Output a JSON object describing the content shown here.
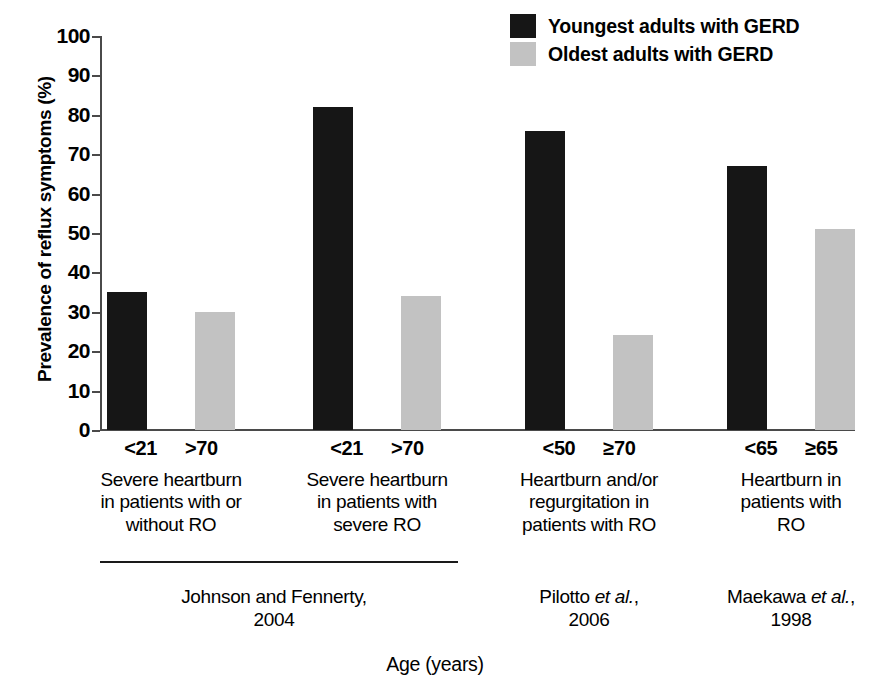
{
  "chart_data": {
    "type": "bar",
    "title": "",
    "xlabel": "Age (years)",
    "ylabel": "Prevalence of reflux symptoms (%)",
    "ylim": [
      0,
      100
    ],
    "ytick_step": 10,
    "yticks": [
      "100",
      "90",
      "80",
      "70",
      "60",
      "50",
      "40",
      "30",
      "20",
      "10",
      "0"
    ],
    "grid": false,
    "legend_position": "top-right",
    "series": [
      {
        "name": "Youngest adults with GERD",
        "color": "#161616",
        "values": [
          35,
          82,
          76,
          67
        ]
      },
      {
        "name": "Oldest adults with GERD",
        "color": "#c2c2c2",
        "values": [
          30,
          34,
          24,
          51
        ]
      }
    ],
    "groups": [
      {
        "age_young": "<21",
        "age_old": ">70",
        "description": "Severe heartburn in patients with or without RO",
        "description_lines": [
          "Severe heartburn",
          "in patients with or",
          "without RO"
        ]
      },
      {
        "age_young": "<21",
        "age_old": ">70",
        "description": "Severe heartburn in patients with severe RO",
        "description_lines": [
          "Severe heartburn",
          "in patients with",
          "severe RO"
        ]
      },
      {
        "age_young": "<50",
        "age_old": "≥70",
        "description": "Heartburn and/or regurgitation in patients with RO",
        "description_lines": [
          "Heartburn and/or",
          "regurgitation in",
          "patients with RO"
        ]
      },
      {
        "age_young": "<65",
        "age_old": "≥65",
        "description": "Heartburn in patients with RO",
        "description_lines": [
          "Heartburn in",
          "patients with",
          "RO"
        ]
      }
    ],
    "studies": [
      {
        "authors": "Johnson and Fennerty,",
        "authors_plain": "Johnson and Fennerty,",
        "italic": "",
        "year": "2004",
        "groups": [
          0,
          1
        ]
      },
      {
        "authors": "Pilotto",
        "italic": "et al.",
        "suffix": ",",
        "year": "2006",
        "groups": [
          2
        ]
      },
      {
        "authors": "Maekawa",
        "italic": "et al.",
        "suffix": ",",
        "year": "1998",
        "groups": [
          3
        ]
      }
    ]
  },
  "colors": {
    "young_bar": "#161616",
    "old_bar": "#c2c2c2",
    "axis": "#4a4a4a",
    "text": "#000000",
    "background": "#ffffff"
  }
}
